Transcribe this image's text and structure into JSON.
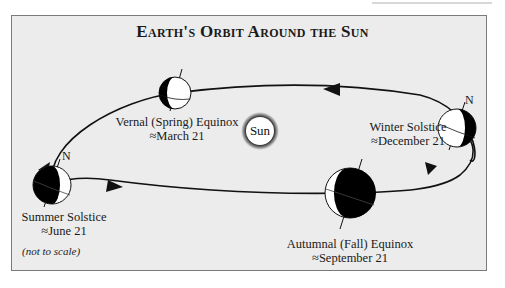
{
  "page": {
    "running_head": ""
  },
  "figure": {
    "title": "Earth's Orbit Around the Sun",
    "sun_label": "Sun",
    "note": "(not to scale)",
    "north_marker": "N",
    "positions": [
      {
        "id": "vernal",
        "name": "Vernal (Spring) Equinox",
        "date": "≈March 21"
      },
      {
        "id": "winter",
        "name": "Winter Solstice",
        "date": "≈December 21"
      },
      {
        "id": "summer",
        "name": "Summer Solstice",
        "date": "≈June 21"
      },
      {
        "id": "autumnal",
        "name": "Autumnal (Fall) Equinox",
        "date": "≈September 21"
      }
    ],
    "colors": {
      "background": "#ececec",
      "frame": "#7a7a7a",
      "ink": "#111111",
      "earth_light": "#ffffff",
      "earth_dark": "#000000"
    }
  }
}
